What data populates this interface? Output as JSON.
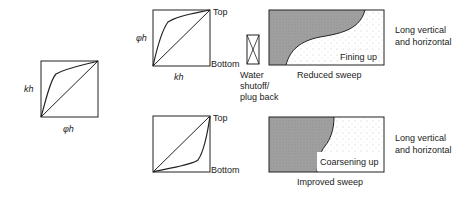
{
  "left_plot": {
    "y_label": "kh",
    "x_label": "φh"
  },
  "top_row": {
    "plot": {
      "y_label": "φh",
      "x_label": "kh",
      "top_label": "Top",
      "bottom_label": "Bottom"
    },
    "action_label": [
      "Water",
      "shutoff/",
      "plug back"
    ],
    "profile_label": "Fining up",
    "caption": "Reduced sweep",
    "scale_note": [
      "Long vertical",
      "and horizontal"
    ]
  },
  "bottom_row": {
    "plot": {
      "top_label": "Top",
      "bottom_label": "Bottom"
    },
    "profile_label": "Coarsening up",
    "caption": "Improved sweep",
    "scale_note": [
      "Long vertical",
      "and horizontal"
    ]
  },
  "colors": {
    "line": "#222222",
    "shade": "#9a9a9a",
    "dots": "#888888"
  }
}
